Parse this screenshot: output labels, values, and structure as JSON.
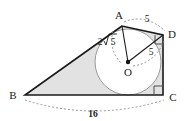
{
  "figure": {
    "type": "geometry-diagram",
    "colors": {
      "stroke": "#1a1a1a",
      "shade_fill": "#e2e2e2",
      "circle_fill": "#ffffff",
      "dashed": "#8c8c8c",
      "center_dot": "#111111",
      "background": "#ffffff"
    },
    "vertices": [
      {
        "name": "A",
        "label": "A",
        "x": 122,
        "y": 26,
        "label_x": 119,
        "label_y": 19
      },
      {
        "name": "B",
        "label": "B",
        "x": 25,
        "y": 95,
        "label_x": 13,
        "label_y": 99
      },
      {
        "name": "C",
        "label": "C",
        "x": 163,
        "y": 95,
        "label_x": 173,
        "label_y": 101
      },
      {
        "name": "D",
        "label": "D",
        "x": 163,
        "y": 35,
        "label_x": 172,
        "label_y": 38
      },
      {
        "name": "O",
        "label": "O",
        "x": 128,
        "y": 62,
        "label_x": 128,
        "label_y": 76
      }
    ],
    "circle": {
      "center_x": 128,
      "center_y": 62,
      "radius": 33
    },
    "measurements": [
      {
        "name": "AD",
        "label": "5",
        "x": 147,
        "y": 22,
        "kind": "plain"
      },
      {
        "name": "AO",
        "label": "2",
        "radical": "5",
        "x": 104,
        "y": 44,
        "kind": "radical"
      },
      {
        "name": "OD",
        "label": "5",
        "x": 151,
        "y": 54,
        "kind": "plain"
      },
      {
        "name": "BC",
        "label": "16",
        "x": 93,
        "y": 114,
        "kind": "plain"
      }
    ],
    "right_angles": [
      {
        "name": "angle-at-C",
        "x": 163,
        "y": 95
      },
      {
        "name": "angle-at-D",
        "x": 163,
        "y": 35
      }
    ]
  }
}
